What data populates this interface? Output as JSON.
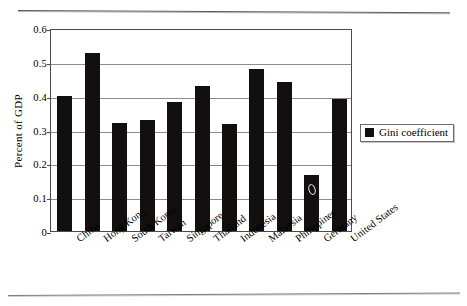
{
  "figure": {
    "top_rule": "horizontal-rule",
    "bottom_rule": "horizontal-rule"
  },
  "chart_data": {
    "type": "bar",
    "title": "",
    "xlabel": "",
    "ylabel": "Percent of GDP",
    "ylim": [
      0,
      0.6
    ],
    "ytick_labels": [
      "0",
      "0.1",
      "0.2",
      "0.3",
      "0.4",
      "0.5",
      "0.6"
    ],
    "ytick_values": [
      0,
      0.1,
      0.2,
      0.3,
      0.4,
      0.5,
      0.6
    ],
    "grid": true,
    "legend_position": "right",
    "legend": [
      "Gini coefficient"
    ],
    "categories": [
      "China",
      "Hong Kong",
      "South Korea",
      "Taiwan",
      "Singapore",
      "Thailand",
      "Indonesia",
      "Malaysia",
      "Philippines",
      "Germany",
      "United States"
    ],
    "series": [
      {
        "name": "Gini coefficient",
        "values": [
          0.4,
          0.525,
          0.318,
          0.327,
          0.38,
          0.428,
          0.315,
          0.478,
          0.441,
          0.165,
          0.39
        ]
      }
    ],
    "annotations": [
      {
        "text": "0",
        "category": "Germany",
        "value": 0.105
      }
    ],
    "colors": {
      "bar": "#120f0e",
      "grid": "#8c8c8c",
      "frame": "#4a4a4a",
      "background": "#ffffff"
    }
  }
}
